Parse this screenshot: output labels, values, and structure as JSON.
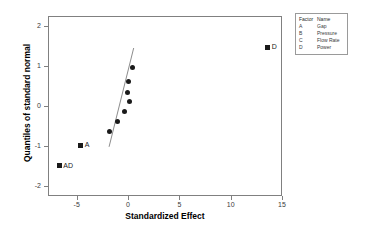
{
  "chart_data": {
    "type": "scatter",
    "title": "",
    "xlabel": "Standardized Effect",
    "ylabel": "Quantiles of standard normal",
    "xlim": [
      -7.8,
      15.0
    ],
    "ylim": [
      -2.25,
      2.25
    ],
    "grid": false,
    "xticks": [
      -5,
      0,
      5,
      10,
      15
    ],
    "xtick_labels": [
      "-5",
      "0",
      "5",
      "10",
      "15"
    ],
    "yticks": [
      2,
      1,
      0,
      -1,
      -2
    ],
    "ytick_labels": [
      "2",
      "1",
      "0",
      "-1",
      "-2"
    ],
    "points": [
      {
        "label": "AD",
        "x": -6.7,
        "y": -1.49,
        "marker": "square",
        "labeled": true
      },
      {
        "label": "A",
        "x": -4.6,
        "y": -0.98,
        "marker": "square",
        "labeled": true
      },
      {
        "label": "",
        "x": -1.85,
        "y": -0.64,
        "marker": "circle",
        "labeled": false
      },
      {
        "label": "",
        "x": -1.0,
        "y": -0.38,
        "marker": "circle",
        "labeled": false
      },
      {
        "label": "",
        "x": -0.35,
        "y": -0.13,
        "marker": "circle",
        "labeled": false
      },
      {
        "label": "",
        "x": 0.1,
        "y": 0.11,
        "marker": "circle",
        "labeled": false
      },
      {
        "label": "",
        "x": -0.1,
        "y": 0.35,
        "marker": "circle",
        "labeled": false
      },
      {
        "label": "",
        "x": 0.05,
        "y": 0.62,
        "marker": "circle",
        "labeled": false
      },
      {
        "label": "",
        "x": 0.4,
        "y": 0.96,
        "marker": "circle",
        "labeled": false
      },
      {
        "label": "D",
        "x": 13.6,
        "y": 1.47,
        "marker": "square",
        "labeled": true
      }
    ],
    "reference_line": {
      "x1": -1.85,
      "y1": -1.02,
      "x2": 0.55,
      "y2": 1.45
    },
    "legend_position": "top-right"
  },
  "legend": {
    "header": {
      "factor": "Factor",
      "name": "Name"
    },
    "rows": [
      {
        "factor": "A",
        "name": "Gap"
      },
      {
        "factor": "B",
        "name": "Pressure"
      },
      {
        "factor": "C",
        "name": "Flow Rate"
      },
      {
        "factor": "D",
        "name": "Power"
      }
    ]
  },
  "colors": {
    "marker": "#1a1a1a",
    "axis": "#808080",
    "text": "#000000",
    "line": "#6e6e6e"
  }
}
